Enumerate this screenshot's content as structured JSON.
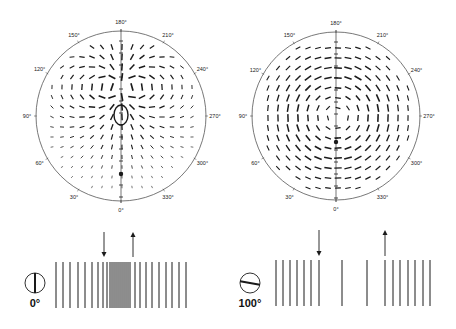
{
  "figure": {
    "panels": [
      {
        "id": "left",
        "polar_plot": {
          "center": [
            121,
            116
          ],
          "radius": 85,
          "angle_labels": [
            "0°",
            "30°",
            "60°",
            "90°",
            "120°",
            "150°",
            "180°",
            "210°",
            "240°",
            "270°",
            "300°",
            "330°"
          ],
          "pattern": "radial-dipole",
          "field_center": [
            121,
            88
          ],
          "marker_dot": [
            121,
            174
          ],
          "inner_ellipse": {
            "cx": 121,
            "cy": 115,
            "rx": 7,
            "ry": 10
          }
        },
        "grating": {
          "orientation_label": "0°",
          "orientation_deg": 0,
          "icon_center": [
            35,
            283
          ],
          "line_top": 262,
          "line_bottom": 308,
          "lines_x": [
            56,
            63,
            70,
            78,
            85,
            92,
            98,
            103,
            107,
            110,
            112,
            114,
            116,
            118,
            120,
            122,
            124,
            126,
            128,
            130,
            135,
            140,
            146,
            152,
            159,
            166,
            172,
            179,
            186
          ],
          "arrow_down_x": 104,
          "arrow_up_x": 133,
          "arrow_top": 232,
          "arrow_bottom": 257
        }
      },
      {
        "id": "right",
        "polar_plot": {
          "center": [
            336,
            116
          ],
          "radius": 84,
          "angle_labels": [
            "0°",
            "30°",
            "60°",
            "90°",
            "120°",
            "150°",
            "180°",
            "210°",
            "240°",
            "270°",
            "300°",
            "330°"
          ],
          "pattern": "concentric",
          "field_center": [
            336,
            116
          ],
          "marker_dot": [
            336,
            142
          ]
        },
        "grating": {
          "orientation_label": "100°",
          "orientation_deg": 100,
          "icon_center": [
            250,
            283
          ],
          "line_top": 260,
          "line_bottom": 306,
          "lines_x": [
            276,
            283,
            290,
            297,
            304,
            311,
            319,
            342,
            367,
            385,
            393,
            400,
            408,
            415,
            423,
            430
          ],
          "arrow_down_x": 319,
          "arrow_up_x": 385,
          "arrow_top": 230,
          "arrow_bottom": 256
        }
      }
    ],
    "colors": {
      "ink": "#1a1a1a",
      "circle": "#555555",
      "background": "#ffffff"
    }
  }
}
